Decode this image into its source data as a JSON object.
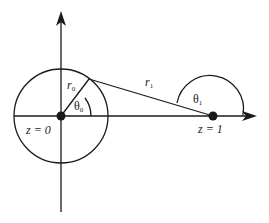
{
  "diagram": {
    "type": "geometry",
    "colors": {
      "stroke": "#1a1a1a",
      "background": "#ffffff"
    },
    "axes": {
      "vertical": {
        "arrow": "up"
      },
      "horizontal": {
        "arrow": "right"
      }
    },
    "points": [
      {
        "id": "origin",
        "label": "z = 0"
      },
      {
        "id": "one",
        "label": "z = 1"
      }
    ],
    "labels": {
      "r0_main": "r",
      "r0_sub": "0",
      "theta0_main": "θ",
      "theta0_sub": "0",
      "r1_main": "r",
      "r1_sub": "1",
      "theta1_main": "θ",
      "theta1_sub": "1",
      "z0": "z = 0",
      "z1": "z = 1"
    }
  }
}
